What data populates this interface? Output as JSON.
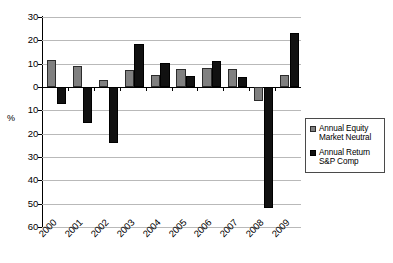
{
  "chart_data": {
    "type": "bar",
    "title": "",
    "subtitle": "",
    "xlabel": "",
    "ylabel": "%",
    "categories": [
      "2000",
      "2001",
      "2002",
      "2003",
      "2004",
      "2005",
      "2006",
      "2007",
      "2008",
      "2009"
    ],
    "ylim": [
      -60,
      30
    ],
    "ytick_labels": [
      "30",
      "20",
      "10",
      "0",
      "10",
      "20",
      "30",
      "40",
      "50",
      "60"
    ],
    "ytick_values": [
      30,
      20,
      10,
      0,
      -10,
      -20,
      -30,
      -40,
      -50,
      -60
    ],
    "grid": true,
    "legend_position": "right",
    "series": [
      {
        "name": "Annual Equity Market Neutral",
        "legend_line_1": "Annual Equity",
        "legend_line_2": "Market Neutral",
        "color": "#808080",
        "values": [
          11.6,
          9.0,
          2.8,
          7.1,
          5.3,
          7.8,
          8.1,
          7.8,
          -6.2,
          5.2
        ]
      },
      {
        "name": "Annual Return S&P Comp",
        "legend_line_1": "Annual Return",
        "legend_line_2": "S&P Comp",
        "color": "#111111",
        "values": [
          -7.3,
          -15.5,
          -24.0,
          18.5,
          10.2,
          4.8,
          11.3,
          4.2,
          -52.0,
          23.2
        ]
      }
    ]
  }
}
